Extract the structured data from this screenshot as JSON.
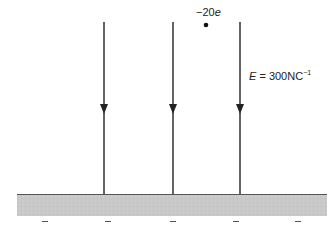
{
  "diagram": {
    "charge": {
      "value": "−20",
      "unit": "e",
      "position": [
        206,
        25
      ]
    },
    "field": {
      "symbol": "E",
      "equals": " = 300NC",
      "exponent": "−1",
      "direction": "downward"
    },
    "field_lines": [
      {
        "x": 104,
        "y_top": 22,
        "y_bottom": 194,
        "arrow_y": 110
      },
      {
        "x": 173,
        "y_top": 22,
        "y_bottom": 194,
        "arrow_y": 110
      },
      {
        "x": 240,
        "y_top": 22,
        "y_bottom": 194,
        "arrow_y": 110
      }
    ],
    "plate": {
      "x": 17,
      "y": 194,
      "width": 310,
      "height": 22,
      "fill": "#c8c8c8",
      "edge": "#555555"
    },
    "plate_charges": {
      "symbol": "−",
      "count": 5,
      "xs": [
        45,
        108,
        173,
        236,
        298
      ],
      "y": 221
    },
    "colors": {
      "line": "#222222",
      "plate": "#c8c8c8"
    }
  }
}
